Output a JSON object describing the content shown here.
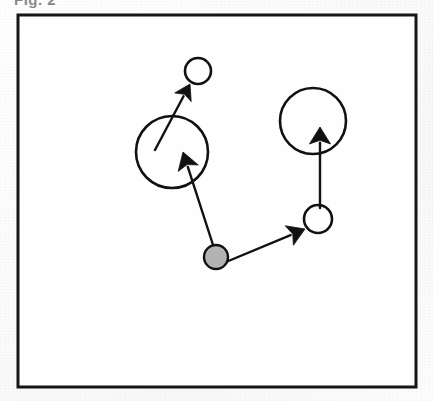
{
  "figure": {
    "clipped_caption_text": "Fig. 2",
    "frame": {
      "x": 18,
      "y": 15,
      "width": 398,
      "height": 372,
      "stroke_color": "#161616",
      "stroke_width": 3,
      "fill_color": "#fefefe"
    },
    "background_color": "#fdfdfd",
    "ink_color": "#111111",
    "highlight_fill_color": "#b3b3b3"
  },
  "diagram_data": {
    "type": "node-link-diagram",
    "description": "Scanned figure: four open circles of two sizes and one gray filled circle, connected by five black arrows indicating motion or influence directions.",
    "nodes": [
      {
        "id": "node-small-top",
        "label": "small-top-circle",
        "cx": 198,
        "cy": 71,
        "r": 13,
        "fill": "none",
        "stroke": "#111111",
        "stroke_width": 2.6,
        "size_class": "small"
      },
      {
        "id": "node-large-left",
        "label": "large-left-circle",
        "cx": 172,
        "cy": 152,
        "r": 36,
        "fill": "none",
        "stroke": "#111111",
        "stroke_width": 2.6,
        "size_class": "large"
      },
      {
        "id": "node-large-right",
        "label": "large-right-circle",
        "cx": 313,
        "cy": 121,
        "r": 33,
        "fill": "none",
        "stroke": "#111111",
        "stroke_width": 2.6,
        "size_class": "large"
      },
      {
        "id": "node-small-right",
        "label": "small-right-circle",
        "cx": 318,
        "cy": 219,
        "r": 14,
        "fill": "none",
        "stroke": "#111111",
        "stroke_width": 2.6,
        "size_class": "small"
      },
      {
        "id": "node-gray-center",
        "label": "gray-source-node",
        "cx": 216,
        "cy": 257,
        "r": 12,
        "fill": "#b3b3b3",
        "stroke": "#111111",
        "stroke_width": 2.4,
        "size_class": "small-filled"
      }
    ],
    "arrows": [
      {
        "id": "arrow-left-inner-to-small-top",
        "from": [
          155,
          150
        ],
        "to": [
          190,
          84
        ],
        "from_node": "node-large-left",
        "to_node": "node-small-top",
        "head_size": 15,
        "line_width": 2.4
      },
      {
        "id": "arrow-gray-to-large-left",
        "from": [
          214,
          248
        ],
        "to": [
          183,
          152
        ],
        "from_node": "node-gray-center",
        "to_node": "node-large-left",
        "head_size": 17,
        "line_width": 2.4
      },
      {
        "id": "arrow-gray-to-small-right",
        "from": [
          226,
          262
        ],
        "to": [
          305,
          229
        ],
        "from_node": "node-gray-center",
        "to_node": "node-small-right",
        "head_size": 17,
        "line_width": 2.4
      },
      {
        "id": "arrow-small-right-to-large-right",
        "from": [
          320,
          208
        ],
        "to": [
          320,
          127
        ],
        "from_node": "node-small-right",
        "to_node": "node-large-right",
        "head_size": 17,
        "line_width": 2.4
      }
    ]
  }
}
